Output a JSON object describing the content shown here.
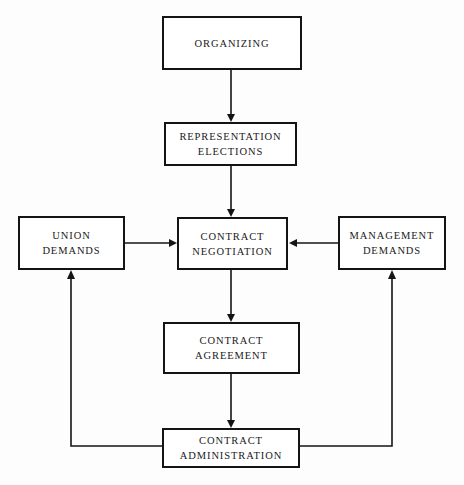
{
  "diagram": {
    "background_color": "#fdfdfd",
    "line_color": "#141414",
    "text_color": "#1a1a1a",
    "nodes": [
      {
        "id": "organizing",
        "label": "ORGANIZING",
        "x": 162,
        "y": 16,
        "w": 140,
        "h": 54
      },
      {
        "id": "representation-elections",
        "label": "REPRESENTATION\nELECTIONS",
        "x": 164,
        "y": 122,
        "w": 133,
        "h": 44
      },
      {
        "id": "union-demands",
        "label": "UNION\nDEMANDS",
        "x": 18,
        "y": 216,
        "w": 107,
        "h": 54
      },
      {
        "id": "contract-negotiation",
        "label": "CONTRACT\nNEGOTIATION",
        "x": 177,
        "y": 217,
        "w": 111,
        "h": 53
      },
      {
        "id": "management-demands",
        "label": "MANAGEMENT\nDEMANDS",
        "x": 338,
        "y": 216,
        "w": 108,
        "h": 54
      },
      {
        "id": "contract-agreement",
        "label": "CONTRACT\nAGREEMENT",
        "x": 163,
        "y": 322,
        "w": 137,
        "h": 52
      },
      {
        "id": "contract-administration",
        "label": "CONTRACT\nADMINISTRATION",
        "x": 162,
        "y": 428,
        "w": 138,
        "h": 40
      }
    ],
    "edges": [
      {
        "id": "organizing-to-elections",
        "from": "organizing",
        "to": "representation-elections",
        "arrow": "down"
      },
      {
        "id": "elections-to-negotiation",
        "from": "representation-elections",
        "to": "contract-negotiation",
        "arrow": "down"
      },
      {
        "id": "union-to-negotiation",
        "from": "union-demands",
        "to": "contract-negotiation",
        "arrow": "right"
      },
      {
        "id": "management-to-negotiation",
        "from": "management-demands",
        "to": "contract-negotiation",
        "arrow": "left"
      },
      {
        "id": "negotiation-to-agreement",
        "from": "contract-negotiation",
        "to": "contract-agreement",
        "arrow": "down"
      },
      {
        "id": "agreement-to-administration",
        "from": "contract-agreement",
        "to": "contract-administration",
        "arrow": "down"
      },
      {
        "id": "administration-to-union-feedback",
        "from": "contract-administration",
        "to": "union-demands",
        "arrow": "up"
      },
      {
        "id": "administration-to-management-feedback",
        "from": "contract-administration",
        "to": "management-demands",
        "arrow": "up"
      }
    ]
  }
}
